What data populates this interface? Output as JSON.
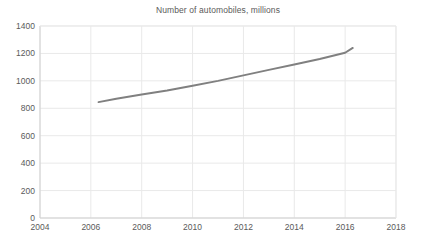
{
  "chart_data": {
    "type": "line",
    "title": "Number of automobiles, millions",
    "xlabel": "",
    "ylabel": "",
    "xlim": [
      2004,
      2018
    ],
    "ylim": [
      0,
      1400
    ],
    "xticks": [
      2004,
      2006,
      2008,
      2010,
      2012,
      2014,
      2016,
      2018
    ],
    "yticks": [
      0,
      200,
      400,
      600,
      800,
      1000,
      1200,
      1400
    ],
    "grid": true,
    "legend": null,
    "series": [
      {
        "name": "Number of automobiles",
        "color": "#808080",
        "x": [
          2006.3,
          2007,
          2008,
          2009,
          2010,
          2011,
          2012,
          2013,
          2014,
          2015,
          2016,
          2016.3
        ],
        "values": [
          845,
          870,
          900,
          930,
          965,
          1000,
          1040,
          1080,
          1120,
          1160,
          1205,
          1240
        ]
      }
    ]
  },
  "axis": {
    "x_tick_labels": [
      "2004",
      "2006",
      "2008",
      "2010",
      "2012",
      "2014",
      "2016",
      "2018"
    ],
    "y_tick_labels": [
      "0",
      "200",
      "400",
      "600",
      "800",
      "1000",
      "1200",
      "1400"
    ]
  },
  "colors": {
    "series_line": "#808080",
    "gridline": "#e9e9e9",
    "axis_line": "#d0d0d0",
    "text": "#5a5a5a",
    "background": "#ffffff"
  }
}
